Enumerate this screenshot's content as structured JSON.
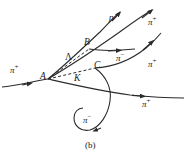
{
  "figure": {
    "caption": "(b)",
    "stroke_color": "#2b2b2b",
    "background": "#ffffff"
  },
  "vertices": [
    {
      "id": "A",
      "label": "A",
      "x": 44,
      "y": 78
    },
    {
      "id": "B",
      "label": "B",
      "x": 88,
      "y": 44
    },
    {
      "id": "C",
      "label": "C",
      "x": 97,
      "y": 67
    },
    {
      "id": "K",
      "label": "K",
      "x": 77,
      "y": 80
    },
    {
      "id": "L",
      "label": "Λ",
      "x": 69,
      "y": 60
    }
  ],
  "tracks": [
    {
      "id": "incoming-pi-plus",
      "label": "π",
      "charge": "+",
      "label_x": 14,
      "label_y": 72
    },
    {
      "id": "proton",
      "label": "p",
      "charge": "",
      "label_x": 113,
      "label_y": 19
    },
    {
      "id": "upper-pi-plus",
      "label": "π",
      "charge": "+",
      "label_x": 152,
      "label_y": 24
    },
    {
      "id": "horizontal-pi-minus",
      "label": "π",
      "charge": "−",
      "label_x": 120,
      "label_y": 59
    },
    {
      "id": "right-pi-plus",
      "label": "π",
      "charge": "+",
      "label_x": 152,
      "label_y": 66
    },
    {
      "id": "lower-pi-plus",
      "label": "π",
      "charge": "+",
      "label_x": 146,
      "label_y": 105
    },
    {
      "id": "spiral-pi-minus",
      "label": "π",
      "charge": "−",
      "label_x": 87,
      "label_y": 122
    }
  ]
}
